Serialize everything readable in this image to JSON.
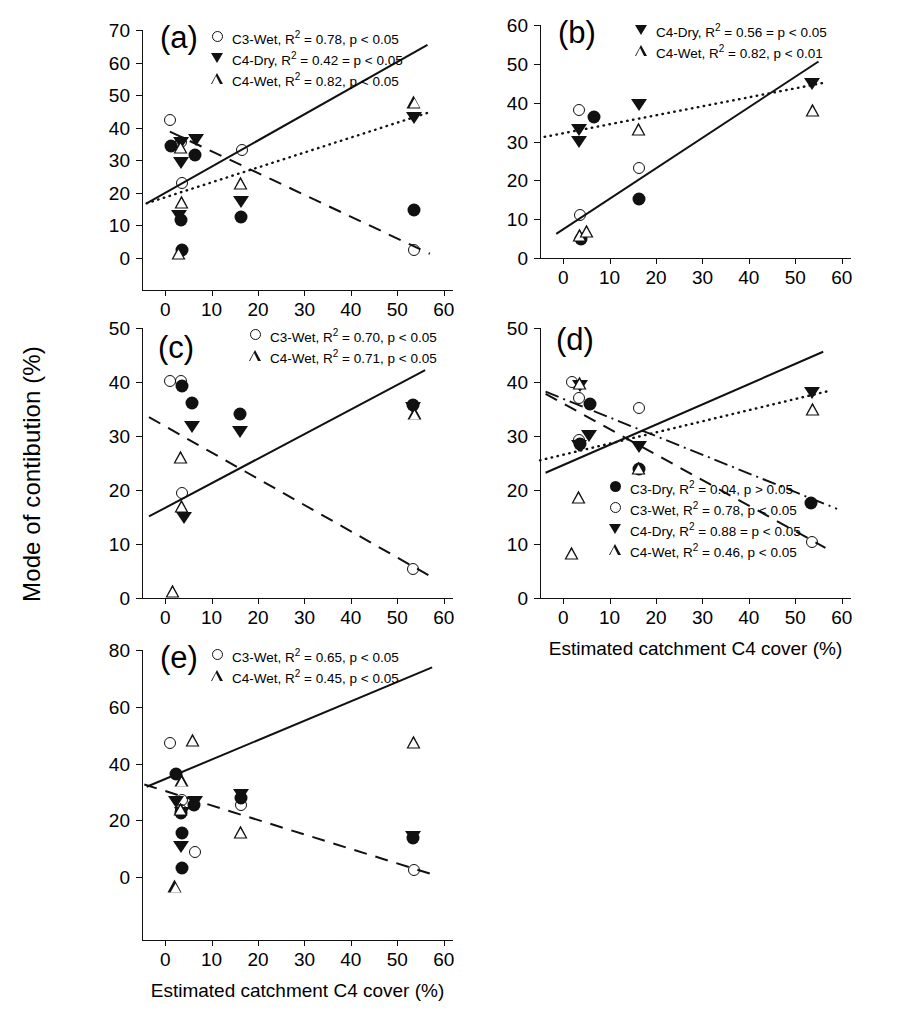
{
  "figure": {
    "y_axis_title": "Mode of contibution (%)",
    "x_axis_title": "Estimated catchment C4 cover (%)"
  },
  "chart_data": [
    {
      "id": "a",
      "type": "scatter",
      "panel_label": "(a)",
      "xlabel": "",
      "ylabel": "",
      "xlim": [
        -5,
        62
      ],
      "ylim": [
        0,
        70
      ],
      "xticks": [
        0,
        10,
        20,
        30,
        40,
        50,
        60
      ],
      "yticks": [
        0,
        10,
        20,
        30,
        40,
        50,
        60,
        70
      ],
      "grid": false,
      "legend_position": "top-center",
      "legend": [
        {
          "marker": "circle-open",
          "label": "C3-Wet, R",
          "sup": "2",
          "stat": "= 0.78, p < 0.05"
        },
        {
          "marker": "tri-down-fill",
          "label": "C4-Dry, R",
          "sup": "2",
          "stat": "= 0.42 = p < 0.05"
        },
        {
          "marker": "tri-up-open",
          "label": "C4-Wet, R",
          "sup": "2",
          "stat": "= 0.82, p < 0.05"
        }
      ],
      "series": [
        {
          "name": "C3-Dry",
          "marker": "circle-fill",
          "points": [
            [
              1.2,
              34.3
            ],
            [
              3.5,
              11.7
            ],
            [
              3.7,
              2.4
            ],
            [
              6.5,
              31.7
            ],
            [
              16.4,
              12.5
            ],
            [
              53.5,
              14.6
            ]
          ]
        },
        {
          "name": "C3-Wet",
          "marker": "circle-open",
          "points": [
            [
              1.0,
              42.3
            ],
            [
              3.3,
              35.5
            ],
            [
              3.6,
              22.9
            ],
            [
              16.5,
              33.3
            ],
            [
              53.6,
              2.6
            ]
          ]
        },
        {
          "name": "C4-Dry",
          "marker": "tri-down-fill",
          "points": [
            [
              3.3,
              35.4
            ],
            [
              3.4,
              29.2
            ],
            [
              2.9,
              12.9
            ],
            [
              6.7,
              36.2
            ],
            [
              16.4,
              17.1
            ],
            [
              53.5,
              43.0
            ]
          ]
        },
        {
          "name": "C4-Wet",
          "marker": "tri-up-open",
          "points": [
            [
              3.3,
              34.1
            ],
            [
              3.6,
              21.2
            ],
            [
              2.9,
              9.6
            ],
            [
              16.4,
              35.1
            ],
            [
              53.7,
              63.8
            ]
          ]
        }
      ],
      "fits": [
        {
          "name": "C4-Wet",
          "style": "solid",
          "x1": -4.0,
          "y1": 16.8,
          "x2": 56.5,
          "y2": 65.4
        },
        {
          "name": "C4-Dry",
          "style": "dotted",
          "x1": -4.0,
          "y1": 16.8,
          "x2": 57.5,
          "y2": 45.0
        },
        {
          "name": "C3-Wet",
          "style": "dashed",
          "x1": 1.0,
          "y1": 38.8,
          "x2": 57.0,
          "y2": 1.3
        }
      ]
    },
    {
      "id": "b",
      "type": "scatter",
      "panel_label": "(b)",
      "xlabel": "",
      "ylabel": "",
      "xlim": [
        -5,
        62
      ],
      "ylim": [
        0,
        60
      ],
      "xticks": [
        0,
        10,
        20,
        30,
        40,
        50,
        60
      ],
      "yticks": [
        0,
        10,
        20,
        30,
        40,
        50,
        60
      ],
      "grid": false,
      "legend_position": "top-center",
      "legend": [
        {
          "marker": "tri-down-fill",
          "label": "C4-Dry, R",
          "sup": "2",
          "stat": "= 0.56 = p < 0.05"
        },
        {
          "marker": "tri-up-open",
          "label": "C4-Wet, R",
          "sup": "2",
          "stat": "= 0.82, p < 0.01"
        }
      ],
      "series": [
        {
          "name": "C3-Dry",
          "marker": "circle-fill",
          "points": [
            [
              3.8,
              5.0
            ],
            [
              6.6,
              36.3
            ],
            [
              16.4,
              15.1
            ]
          ]
        },
        {
          "name": "C3-Wet",
          "marker": "circle-open",
          "points": [
            [
              3.3,
              38.2
            ],
            [
              3.7,
              11.1
            ],
            [
              16.4,
              23.2
            ]
          ]
        },
        {
          "name": "C4-Dry",
          "marker": "tri-down-fill",
          "points": [
            [
              3.4,
              33.0
            ],
            [
              3.5,
              30.0
            ],
            [
              16.3,
              39.3
            ],
            [
              53.7,
              44.8
            ]
          ]
        },
        {
          "name": "C4-Wet",
          "marker": "tri-up-open",
          "points": [
            [
              3.7,
              5.9
            ],
            [
              5.2,
              10.2
            ],
            [
              16.3,
              40.0
            ],
            [
              53.9,
              48.2
            ]
          ]
        }
      ],
      "fits": [
        {
          "name": "C4-Wet",
          "style": "solid",
          "x1": -1.5,
          "y1": 6.2,
          "x2": 55.0,
          "y2": 50.6
        },
        {
          "name": "C4-Dry",
          "style": "dotted",
          "x1": -4.0,
          "y1": 31.2,
          "x2": 56.5,
          "y2": 45.2
        }
      ]
    },
    {
      "id": "c",
      "type": "scatter",
      "panel_label": "(c)",
      "xlabel": "",
      "ylabel": "",
      "xlim": [
        -5,
        62
      ],
      "ylim": [
        0,
        50
      ],
      "xticks": [
        0,
        10,
        20,
        30,
        40,
        50,
        60
      ],
      "yticks": [
        0,
        10,
        20,
        30,
        40,
        50
      ],
      "grid": false,
      "legend_position": "top-center",
      "legend": [
        {
          "marker": "circle-open",
          "label": "C3-Wet, R",
          "sup": "2",
          "stat": "= 0.70, p < 0.05"
        },
        {
          "marker": "tri-up-open",
          "label": "C4-Wet, R",
          "sup": "2",
          "stat": "= 0.71, p < 0.05"
        }
      ],
      "series": [
        {
          "name": "C3-Dry",
          "marker": "circle-fill",
          "points": [
            [
              3.6,
              39.3
            ],
            [
              5.8,
              36.1
            ],
            [
              16.2,
              34.1
            ],
            [
              53.4,
              35.7
            ]
          ]
        },
        {
          "name": "C3-Wet",
          "marker": "circle-open",
          "points": [
            [
              1.0,
              40.2
            ],
            [
              3.4,
              40.2
            ],
            [
              3.6,
              19.4
            ],
            [
              53.4,
              5.3
            ]
          ]
        },
        {
          "name": "C4-Dry",
          "marker": "tri-down-fill",
          "points": [
            [
              5.7,
              31.6
            ],
            [
              16.2,
              30.7
            ],
            [
              53.4,
              35.1
            ],
            [
              4.0,
              14.9
            ]
          ]
        },
        {
          "name": "C4-Wet",
          "marker": "tri-up-open",
          "points": [
            [
              3.4,
              26.1
            ],
            [
              3.7,
              19.5
            ],
            [
              1.6,
              6.2
            ],
            [
              53.9,
              41.4
            ]
          ]
        }
      ],
      "fits": [
        {
          "name": "C4-Wet",
          "style": "solid",
          "x1": -3.5,
          "y1": 15.1,
          "x2": 56.0,
          "y2": 42.2
        },
        {
          "name": "C3-Wet",
          "style": "dashed",
          "x1": -3.5,
          "y1": 33.5,
          "x2": 58.0,
          "y2": 3.6
        }
      ]
    },
    {
      "id": "d",
      "type": "scatter",
      "panel_label": "(d)",
      "xlabel": "Estimated catchment C4 cover (%)",
      "ylabel": "",
      "xlim": [
        -5,
        62
      ],
      "ylim": [
        0,
        50
      ],
      "xticks": [
        0,
        10,
        20,
        30,
        40,
        50,
        60
      ],
      "yticks": [
        0,
        10,
        20,
        30,
        40,
        50
      ],
      "grid": false,
      "legend_position": "bottom-center",
      "legend": [
        {
          "marker": "circle-fill",
          "label": "C3-Dry, R",
          "sup": "2",
          "stat": "= 0.04, p > 0.05"
        },
        {
          "marker": "circle-open",
          "label": "C3-Wet, R",
          "sup": "2",
          "stat": "= 0.78, p < 0.05"
        },
        {
          "marker": "tri-down-fill",
          "label": "C4-Dry, R",
          "sup": "2",
          "stat": "= 0.88 = p < 0.05"
        },
        {
          "marker": "tri-up-open",
          "label": "C4-Wet, R",
          "sup": "2",
          "stat": "= 0.46, p < 0.05"
        }
      ],
      "series": [
        {
          "name": "C3-Dry",
          "marker": "circle-fill",
          "points": [
            [
              5.8,
              36.0
            ],
            [
              3.6,
              28.6
            ],
            [
              16.3,
              23.9
            ],
            [
              53.3,
              17.6
            ]
          ]
        },
        {
          "name": "C3-Wet",
          "marker": "circle-open",
          "points": [
            [
              2.0,
              40.0
            ],
            [
              3.4,
              37.0
            ],
            [
              3.5,
              29.2
            ],
            [
              16.4,
              35.2
            ],
            [
              53.7,
              10.3
            ]
          ]
        },
        {
          "name": "C4-Dry",
          "marker": "tri-down-fill",
          "points": [
            [
              3.7,
              39.2
            ],
            [
              3.5,
              28.2
            ],
            [
              5.6,
              30.0
            ],
            [
              16.3,
              28.0
            ],
            [
              53.6,
              37.9
            ]
          ]
        },
        {
          "name": "C4-Wet",
          "marker": "tri-up-open",
          "points": [
            [
              3.7,
              39.8
            ],
            [
              3.4,
              21.1
            ],
            [
              1.8,
              13.1
            ],
            [
              16.3,
              31.3
            ],
            [
              53.9,
              44.6
            ]
          ]
        }
      ],
      "fits": [
        {
          "name": "C4-Wet",
          "style": "solid",
          "x1": -3.8,
          "y1": 23.2,
          "x2": 56.0,
          "y2": 45.6
        },
        {
          "name": "C4-Dry",
          "style": "dotted",
          "x1": -5.0,
          "y1": 25.5,
          "x2": 57.5,
          "y2": 38.4
        },
        {
          "name": "C3-Wet",
          "style": "dashed",
          "x1": -3.8,
          "y1": 37.8,
          "x2": 56.5,
          "y2": 9.3
        },
        {
          "name": "C3-Dry",
          "style": "dashdot",
          "x1": -3.8,
          "y1": 38.2,
          "x2": 59.0,
          "y2": 16.5
        }
      ]
    },
    {
      "id": "e",
      "type": "scatter",
      "panel_label": "(e)",
      "xlabel": "Estimated catchment C4 cover (%)",
      "ylabel": "",
      "xlim": [
        -5,
        62
      ],
      "ylim": [
        0,
        80
      ],
      "xticks": [
        0,
        10,
        20,
        30,
        40,
        50,
        60
      ],
      "yticks": [
        0,
        20,
        40,
        60,
        80
      ],
      "grid": false,
      "legend_position": "top-center",
      "legend": [
        {
          "marker": "circle-open",
          "label": "C3-Wet, R",
          "sup": "2",
          "stat": "= 0.65, p < 0.05"
        },
        {
          "marker": "tri-up-open",
          "label": "C4-Wet, R",
          "sup": "2",
          "stat": "= 0.45, p < 0.05"
        }
      ],
      "series": [
        {
          "name": "C3-Dry",
          "marker": "circle-fill",
          "points": [
            [
              2.3,
              36.4
            ],
            [
              3.5,
              22.5
            ],
            [
              6.3,
              25.2
            ],
            [
              3.6,
              15.4
            ],
            [
              3.6,
              3.3
            ],
            [
              16.3,
              28.0
            ],
            [
              53.3,
              13.6
            ]
          ]
        },
        {
          "name": "C3-Wet",
          "marker": "circle-open",
          "points": [
            [
              1.1,
              47.2
            ],
            [
              3.6,
              27.3
            ],
            [
              3.5,
              23.5
            ],
            [
              6.5,
              8.7
            ],
            [
              16.4,
              25.3
            ],
            [
              53.5,
              2.3
            ]
          ]
        },
        {
          "name": "C4-Dry",
          "marker": "tri-down-fill",
          "points": [
            [
              2.4,
              26.5
            ],
            [
              3.6,
              22.6
            ],
            [
              6.5,
              26.6
            ],
            [
              3.4,
              10.6
            ],
            [
              16.4,
              28.9
            ],
            [
              53.3,
              14.1
            ]
          ]
        },
        {
          "name": "C4-Wet",
          "marker": "tri-up-open",
          "points": [
            [
              5.9,
              48.3
            ],
            [
              3.7,
              38.6
            ],
            [
              3.4,
              33.1
            ],
            [
              2.2,
              10.4
            ],
            [
              16.3,
              34.3
            ],
            [
              53.5,
              70.5
            ]
          ]
        }
      ],
      "fits": [
        {
          "name": "C4-Wet",
          "style": "solid",
          "x1": -4.0,
          "y1": 31.8,
          "x2": 57.5,
          "y2": 73.9
        },
        {
          "name": "C3-Wet",
          "style": "dashed",
          "x1": -4.5,
          "y1": 32.6,
          "x2": 58.0,
          "y2": 0.7
        }
      ]
    }
  ]
}
